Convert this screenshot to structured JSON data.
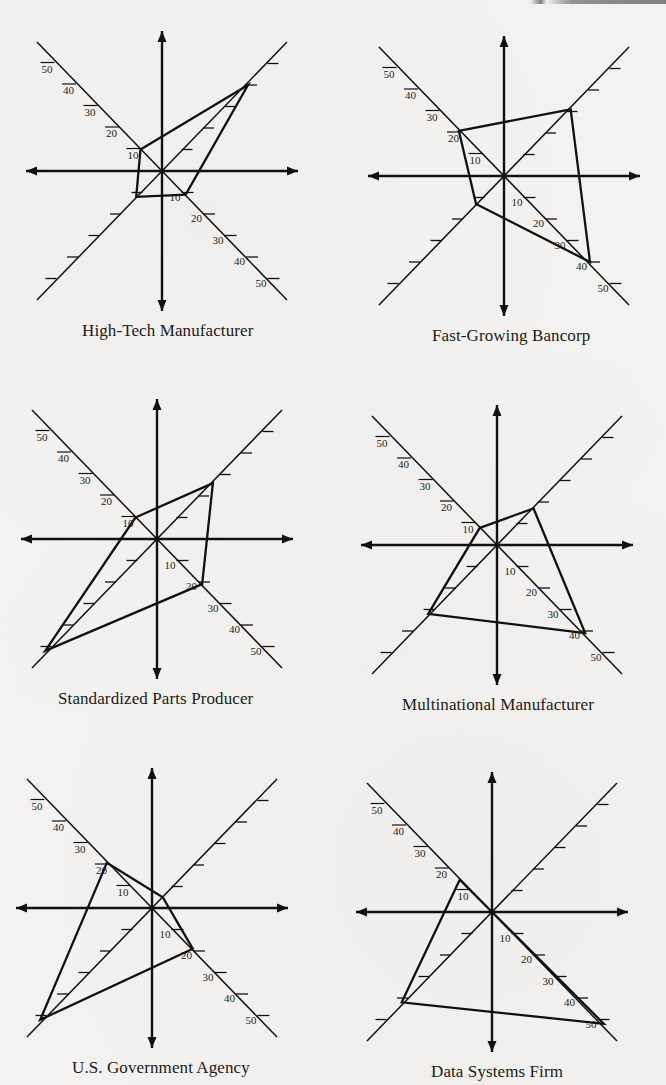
{
  "figure": {
    "axis_labels": [
      "10",
      "20",
      "30",
      "40",
      "50"
    ],
    "charts": [
      {
        "id": "high-tech",
        "caption": "High-Tech Manufacturer",
        "center": [
          162,
          171
        ],
        "values": {
          "nw": 10,
          "ne": 40,
          "se": 11,
          "sw": 12
        }
      },
      {
        "id": "bancorp",
        "caption": "Fast-Growing Bancorp",
        "center": [
          504,
          176
        ],
        "values": {
          "nw": 21,
          "ne": 31,
          "se": 40,
          "sw": 13
        }
      },
      {
        "id": "standardized",
        "caption": "Standardized Parts Producer",
        "center": [
          157,
          539
        ],
        "values": {
          "nw": 10,
          "ne": 26,
          "se": 21,
          "sw": 52
        }
      },
      {
        "id": "multinational",
        "caption": "Multinational Manufacturer",
        "center": [
          497,
          545
        ],
        "values": {
          "nw": 8,
          "ne": 17,
          "se": 41,
          "sw": 32
        }
      },
      {
        "id": "us-gov",
        "caption": "U.S. Government Agency",
        "center": [
          152,
          908
        ],
        "values": {
          "nw": 21,
          "ne": 5,
          "se": 19,
          "sw": 52
        }
      },
      {
        "id": "data-systems",
        "caption": "Data Systems Firm",
        "center": [
          492,
          912
        ],
        "values": {
          "nw": 15,
          "ne": 0,
          "se": 52,
          "sw": 42
        }
      }
    ]
  },
  "chart_data": [
    {
      "type": "radar",
      "title": "High-Tech Manufacturer",
      "axes": [
        "NW",
        "NE",
        "SE",
        "SW"
      ],
      "values": [
        10,
        40,
        11,
        12
      ],
      "axis_range": [
        0,
        50
      ]
    },
    {
      "type": "radar",
      "title": "Fast-Growing Bancorp",
      "axes": [
        "NW",
        "NE",
        "SE",
        "SW"
      ],
      "values": [
        21,
        31,
        40,
        13
      ],
      "axis_range": [
        0,
        50
      ]
    },
    {
      "type": "radar",
      "title": "Standardized Parts Producer",
      "axes": [
        "NW",
        "NE",
        "SE",
        "SW"
      ],
      "values": [
        10,
        26,
        21,
        52
      ],
      "axis_range": [
        0,
        50
      ]
    },
    {
      "type": "radar",
      "title": "Multinational Manufacturer",
      "axes": [
        "NW",
        "NE",
        "SE",
        "SW"
      ],
      "values": [
        8,
        17,
        41,
        32
      ],
      "axis_range": [
        0,
        50
      ]
    },
    {
      "type": "radar",
      "title": "U.S. Government Agency",
      "axes": [
        "NW",
        "NE",
        "SE",
        "SW"
      ],
      "values": [
        21,
        5,
        19,
        52
      ],
      "axis_range": [
        0,
        50
      ]
    },
    {
      "type": "radar",
      "title": "Data Systems Firm",
      "axes": [
        "NW",
        "NE",
        "SE",
        "SW"
      ],
      "values": [
        15,
        0,
        52,
        42
      ],
      "axis_range": [
        0,
        50
      ]
    }
  ]
}
